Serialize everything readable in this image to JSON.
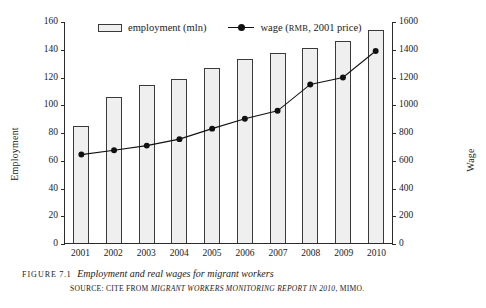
{
  "figure": {
    "label": "FIGURE",
    "number": "7.1",
    "title": "Employment and real wages for migrant workers",
    "source_prefix": "SOURCE: CITE FROM",
    "source_italic": "MIGRANT WORKERS MONITORING REPORT IN 2010",
    "source_suffix": ", MIMO."
  },
  "legend": {
    "position": "top-inside",
    "items": [
      {
        "name": "employment",
        "label": "employment (mln)",
        "marker": "bar-swatch",
        "color": "#efefef",
        "border": "#3a3a3a"
      },
      {
        "name": "wage",
        "label_pre": "wage (",
        "label_sc": "RMB",
        "label_post": ", 2001 price)",
        "marker": "line-dot",
        "color": "#111111"
      }
    ]
  },
  "chart_data": {
    "type": "bar",
    "title": "Employment and real wages for migrant workers",
    "xlabel": "",
    "categories": [
      "2001",
      "2002",
      "2003",
      "2004",
      "2005",
      "2006",
      "2007",
      "2008",
      "2009",
      "2010"
    ],
    "grid": false,
    "series": [
      {
        "name": "employment (mln)",
        "type": "bar",
        "axis": "left",
        "ylabel": "Employment",
        "ylim": [
          0,
          160
        ],
        "ytick_step": 20,
        "yticks": [
          0,
          20,
          40,
          60,
          80,
          100,
          120,
          140,
          160
        ],
        "values": [
          84,
          105,
          114,
          118.5,
          126,
          132.5,
          137,
          140.5,
          145.5,
          153.5
        ],
        "color": "#efefef",
        "border": "#3a3a3a"
      },
      {
        "name": "wage (RMB, 2001 price)",
        "type": "line",
        "axis": "right",
        "ylabel": "Wage",
        "ylim": [
          0,
          1600
        ],
        "ytick_step": 200,
        "yticks": [
          0,
          200,
          400,
          600,
          800,
          1000,
          1200,
          1400,
          1600
        ],
        "values": [
          640,
          672,
          705,
          752,
          828,
          900,
          957,
          1148,
          1198,
          1390
        ],
        "color": "#111111",
        "marker": "circle"
      }
    ]
  }
}
